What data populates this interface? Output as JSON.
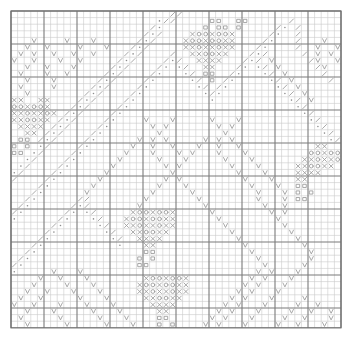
{
  "chart_type": "cross-stitch-pattern-chart",
  "title": "",
  "grid": {
    "columns": 50,
    "rows": 48,
    "cell_size_px": 6.6,
    "origin_x_px": 11,
    "origin_y_px": 11,
    "major_line_every": 5,
    "minor_line_color": "#c9c9c9",
    "major_line_color": "#7a7a7a",
    "border_color": "#6e6e6e",
    "background_color": "#ffffff"
  },
  "legend": {
    "symbol_color": "#9a9a9a",
    "symbols": [
      {
        "key": "X",
        "name": "cross-symbol",
        "glyph": "X"
      },
      {
        "key": "O",
        "name": "circle-symbol",
        "glyph": "O"
      },
      {
        "key": "V",
        "name": "check-symbol",
        "glyph": "v"
      },
      {
        "key": "D",
        "name": "dot-symbol",
        "glyph": "."
      },
      {
        "key": "S",
        "name": "slash-symbol",
        "glyph": "/"
      },
      {
        "key": "B",
        "name": "square-symbol",
        "glyph": "#"
      }
    ]
  },
  "chart_data": {
    "type": "heatmap",
    "xlabel": "",
    "ylabel": "",
    "grid": true,
    "legend_position": "none",
    "categories": [
      "X",
      "O",
      "V",
      "D",
      "S",
      "B"
    ],
    "rows": 48,
    "columns": 50,
    "cells": [
      "........................SS........................",
      "......................DSS.....BB..BB......S.......",
      ".....................SD......B.BB.B.....SD.S......",
      "....................SDS....XOOXOOX.....SD..S......",
      "...V....V...V......SDS....XOOXOOXX....SD...S...V..",
      "..V..V....V...V...SDS.....XXOXXOXX...SD....S..V..V",
      ".V.V..V..V..V....SDS....S..XXOOXX...SDS.....S.V.V.",
      "V..V...V..V.....SDS....SDS..XXXX...SDS.V.....SV..V",
      "..V..V...V.....SDS....SD.DS..XX...SD.DS.V.....SV..",
      ".V...V..V.....SDS....SD...DS.BB..SD...DS.V.....S..",
      "..V...V......SDS....SD.....DS.B.SD.....DS.V.....S.",
      ".V....V.....SDS....SD.......DS.SD.......DS.V......",
      "..V........SDS....SD.........DSD.........DS.V.....",
      "XX..XX....SDS....SD...........D...........DS.V....",
      "OOXOOX...SDS....SD.........................DS.....",
      "XXOXXOX.SDS....SD...........................DS....",
      "XXOOXX.SDS....SD....V...V.....V...V..........DS...",
      ".XXXX.SDS....SD......V.V.......V.V............DS..",
      "..XX.SDS....SD........V.........V..............DS.",
      ".BB.SDS....SD......V.V.V.....V.V.V..............DS",
      "B.B.DS....SD......V..V..V...V..V..V...........XX..",
      "BB.DS....SD......V...V...V.V...V...V.........OOXOO",
      "..DS....SD......V.....V...V.....V...V.......XXOXXO",
      ".DS....SD......V.......V.V.......V...V.....XXOOXX.",
      "DS....SD......V.........V.........V...V....XXXX...",
      "S....SD......V.........V.V.........V...V...XX.....",
      "....SD......V.........V...V.........V...V..BB.....",
      "...SD......V.........V.....V.........V...V.B.B....",
      "..SD......SS........V.......V........V...V.BB.....",
      ".SD......SDS.......V.........V........V..V........",
      "SD......SD.DS.....XOOXOOX.....V........V.V........",
      "D......SD...DS...XOOXOOXX......V........V.........",
      "......SD.....DS..XXOXXOXX.......V........V........",
      ".....SD.......DS..XXOOXX.........V........V.......",
      "....SD.........DS..XXXX...........V........V......",
      "...SD...........D...XX.............V........V.....",
      "..SD................BB..............V........V....",
      ".SD................B.B...............V.......V....",
      "SD.................BB.................V.....V.....",
      "D.....V...V..........................V.V...V......",
      "....V..V...V........XOOXOOX.........V.V...V.......",
      "...V....V...V......XOOXOOXX........V.V...V........",
      "..V..V...V...V.....XXOXXOXX.......V.V...V.........",
      ".V..V.....V...V.....XXOOXX.......V.V...V....V.....",
      "V..V...V...V...V.....XXXX.......V.V...V....V..V...",
      "..V...V.....V...V.....XX.......V.V...V....V..V..V.",
      ".V.....V.....V...V....BB......V.V...V....V..V...V.",
      "..V.....V.....V...V...B.B....V.V...V....V..V...V.."
    ]
  }
}
